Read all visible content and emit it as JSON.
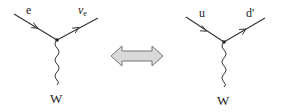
{
  "diagram": {
    "type": "feynman-diagram-comparison",
    "left_vertex": {
      "incoming_label": "e",
      "outgoing_label_main": "ν",
      "outgoing_label_sub": "e",
      "boson_label": "W"
    },
    "equivalence_symbol": "double-arrow",
    "right_vertex": {
      "incoming_label": "u",
      "outgoing_label": "d′",
      "boson_label": "W"
    }
  },
  "colors": {
    "line": "#333333",
    "arrow_fill": "#d9d9d9",
    "arrow_stroke": "#777777",
    "background": "#ffffff"
  }
}
